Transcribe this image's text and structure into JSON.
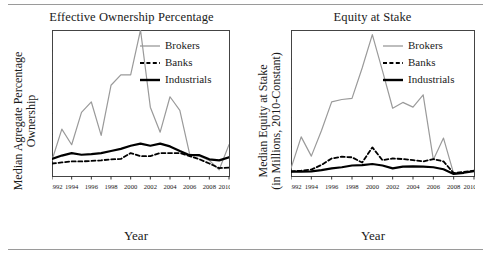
{
  "figure": {
    "background": "#ffffff",
    "rule_color": "#9a9a9a",
    "series_colors": {
      "brokers": "#9a9a9a",
      "banks": "#000000",
      "industrials": "#000000"
    },
    "axis_title_x": "Year"
  },
  "chart_data": [
    {
      "type": "line",
      "id": "effective-ownership-percentage",
      "title": "Effective Ownership Percentage",
      "xlabel": "Year",
      "ylabel": "Median Agregate Percentage Ownership",
      "ylabel_lines": [
        "Median Agregate Percentage",
        "Ownership"
      ],
      "grid": false,
      "legend_position": "top-right",
      "x": [
        1992,
        1993,
        1994,
        1995,
        1996,
        1997,
        1998,
        1999,
        2000,
        2001,
        2002,
        2003,
        2004,
        2005,
        2006,
        2007,
        2008,
        2009,
        2010
      ],
      "xlim": [
        1992,
        2010
      ],
      "ylim": [
        0,
        7
      ],
      "yticks": [
        0,
        1,
        2,
        3,
        4,
        5,
        6,
        7
      ],
      "ytick_labels": [
        "0%",
        "1%",
        "2%",
        "3%",
        "4%",
        "5%",
        "6%",
        "7%"
      ],
      "xticks": [
        1992,
        1994,
        1996,
        1998,
        2000,
        2002,
        2004,
        2006,
        2008,
        2010
      ],
      "xtick_labels": [
        "1992",
        "1994",
        "1996",
        "1998",
        "2000",
        "2002",
        "2004",
        "2006",
        "2008",
        "2010"
      ],
      "series": [
        {
          "name": "Brokers",
          "style": "solid-thin",
          "color": "#9a9a9a",
          "values": [
            0.75,
            2.25,
            1.5,
            3.05,
            3.55,
            1.95,
            4.35,
            4.85,
            4.85,
            7.0,
            3.3,
            2.1,
            3.8,
            3.15,
            1.05,
            0.95,
            0.75,
            0.3,
            1.5
          ]
        },
        {
          "name": "Banks",
          "style": "dashed",
          "color": "#000000",
          "values": [
            0.6,
            0.65,
            0.7,
            0.7,
            0.72,
            0.75,
            0.8,
            0.82,
            1.1,
            0.95,
            0.95,
            1.1,
            1.1,
            1.1,
            0.95,
            0.8,
            0.6,
            0.38,
            0.4
          ]
        },
        {
          "name": "Industrials",
          "style": "solid-thick",
          "color": "#000000",
          "values": [
            0.82,
            0.98,
            1.1,
            1.02,
            1.05,
            1.1,
            1.2,
            1.3,
            1.45,
            1.55,
            1.45,
            1.55,
            1.42,
            1.2,
            1.0,
            1.0,
            0.8,
            0.75,
            0.9
          ]
        }
      ]
    },
    {
      "type": "line",
      "id": "equity-at-stake",
      "title": "Equity at Stake",
      "xlabel": "Year",
      "ylabel": "Median Equity at Stake (in Millions, 2010-Constant)",
      "ylabel_lines": [
        "Median Equity at Stake",
        "(in Millions, 2010-Constant)"
      ],
      "grid": false,
      "legend_position": "top-right",
      "x": [
        1992,
        1993,
        1994,
        1995,
        1996,
        1997,
        1998,
        1999,
        2000,
        2001,
        2002,
        2003,
        2004,
        2005,
        2006,
        2007,
        2008,
        2009,
        2010
      ],
      "xlim": [
        1992,
        2010
      ],
      "ylim": [
        0,
        25
      ],
      "yticks": [
        0,
        5,
        10,
        15,
        20,
        25
      ],
      "ytick_labels": [
        "$0",
        "$5",
        "$10",
        "$15",
        "$20",
        "$25"
      ],
      "xticks": [
        1992,
        1994,
        1996,
        1998,
        2000,
        2002,
        2004,
        2006,
        2008,
        2010
      ],
      "xtick_labels": [
        "1992",
        "1994",
        "1996",
        "1998",
        "2000",
        "2002",
        "2004",
        "2006",
        "2008",
        "2010"
      ],
      "series": [
        {
          "name": "Brokers",
          "style": "solid-thin",
          "color": "#9a9a9a",
          "values": [
            1.3,
            6.7,
            3.4,
            7.8,
            12.7,
            13.1,
            13.3,
            18.5,
            24.2,
            18.0,
            11.6,
            12.6,
            11.8,
            13.9,
            2.8,
            6.5,
            0.4,
            0.6,
            0.9
          ]
        },
        {
          "name": "Banks",
          "style": "dashed",
          "color": "#000000",
          "values": [
            0.8,
            0.9,
            1.1,
            1.9,
            3.0,
            3.3,
            3.2,
            2.3,
            4.9,
            2.7,
            3.0,
            2.9,
            2.7,
            2.5,
            2.9,
            2.5,
            0.5,
            0.7,
            0.9
          ]
        },
        {
          "name": "Industrials",
          "style": "solid-thick",
          "color": "#000000",
          "values": [
            0.75,
            0.75,
            0.8,
            1.0,
            1.3,
            1.5,
            1.8,
            1.85,
            2.05,
            1.8,
            1.3,
            1.6,
            1.65,
            1.6,
            1.5,
            1.15,
            0.35,
            0.55,
            0.85
          ]
        }
      ]
    }
  ]
}
